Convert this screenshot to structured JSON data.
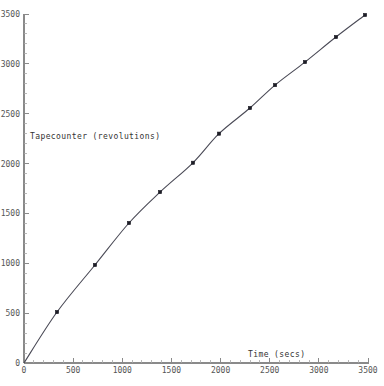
{
  "chart_data": {
    "type": "line",
    "title": "",
    "subtitle": "",
    "xlabel": "Time (secs)",
    "ylabel": "Tapecounter (revolutions)",
    "xlim": [
      0,
      3500
    ],
    "ylim": [
      0,
      3500
    ],
    "xticks": [
      0,
      500,
      1000,
      1500,
      2000,
      2500,
      3000,
      3500
    ],
    "yticks": [
      0,
      500,
      1000,
      1500,
      2000,
      2500,
      3000,
      3500
    ],
    "xtick_labels": [
      "0",
      "500",
      "1000",
      "1500",
      "2000",
      "2500",
      "3000",
      "3500"
    ],
    "ytick_labels": [
      "0",
      "500",
      "1000",
      "1500",
      "2000",
      "2500",
      "3000",
      "3500"
    ],
    "minor_tick_step": 100,
    "grid": false,
    "legend": null,
    "legend_position": "none",
    "marker": "square",
    "line_style": "solid",
    "series": [
      {
        "name": "Tapecounter vs Time",
        "x": [
          0,
          336,
          722,
          1068,
          1384,
          1719,
          1984,
          2299,
          2554,
          2859,
          3174,
          3470
        ],
        "y": [
          0,
          511,
          983,
          1404,
          1714,
          2008,
          2300,
          2557,
          2787,
          3018,
          3269,
          3490
        ]
      }
    ],
    "annotations": []
  },
  "labels": {
    "y_axis_title": "Tapecounter (revolutions)",
    "x_axis_title": "Time (secs)"
  },
  "colors": {
    "background": "#ffffff",
    "axis": "#8a8a8a",
    "curve": "#4a4a56",
    "marker": "#1d1d26",
    "tick_text": "#555555",
    "title_text": "#333333"
  }
}
